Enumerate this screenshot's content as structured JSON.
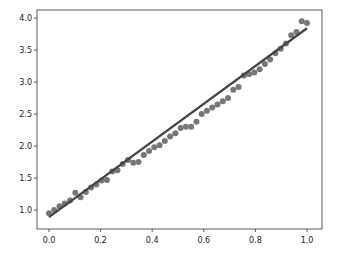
{
  "chart_data": {
    "type": "scatter",
    "title": "",
    "xlabel": "",
    "ylabel": "",
    "xlim": [
      -0.05,
      1.05
    ],
    "ylim": [
      0.7,
      4.1
    ],
    "grid": false,
    "legend": null,
    "xticks": [
      0.0,
      0.2,
      0.4,
      0.6,
      0.8,
      1.0
    ],
    "xtick_labels": [
      "0.0",
      "0.2",
      "0.4",
      "0.6",
      "0.8",
      "1.0"
    ],
    "yticks": [
      1.0,
      1.5,
      2.0,
      2.5,
      3.0,
      3.5,
      4.0
    ],
    "ytick_labels": [
      "1.0",
      "1.5",
      "2.0",
      "2.5",
      "3.0",
      "3.5",
      "4.0"
    ],
    "series": [
      {
        "name": "data",
        "kind": "scatter",
        "color": "#777777",
        "x": [
          0.0,
          0.0204,
          0.0408,
          0.0612,
          0.0816,
          0.102,
          0.1224,
          0.1429,
          0.1633,
          0.1837,
          0.2041,
          0.2245,
          0.2449,
          0.2653,
          0.2857,
          0.3061,
          0.3265,
          0.3469,
          0.3673,
          0.3878,
          0.4082,
          0.4286,
          0.449,
          0.4694,
          0.4898,
          0.5102,
          0.5306,
          0.551,
          0.5714,
          0.5918,
          0.6122,
          0.6327,
          0.6531,
          0.6735,
          0.6939,
          0.7143,
          0.7347,
          0.7551,
          0.7755,
          0.7959,
          0.8163,
          0.8367,
          0.8571,
          0.8776,
          0.898,
          0.9184,
          0.9388,
          0.9592,
          0.9796,
          1.0
        ],
        "y": [
          0.95,
          1.0,
          1.06,
          1.1,
          1.15,
          1.27,
          1.2,
          1.28,
          1.35,
          1.4,
          1.46,
          1.47,
          1.6,
          1.62,
          1.72,
          1.78,
          1.74,
          1.75,
          1.86,
          1.92,
          1.98,
          2.01,
          2.08,
          2.15,
          2.2,
          2.28,
          2.3,
          2.3,
          2.38,
          2.5,
          2.55,
          2.6,
          2.65,
          2.7,
          2.75,
          2.88,
          2.92,
          3.1,
          3.12,
          3.15,
          3.2,
          3.28,
          3.35,
          3.45,
          3.52,
          3.6,
          3.73,
          3.78,
          3.95,
          3.92
        ]
      },
      {
        "name": "fit",
        "kind": "line",
        "color": "#444444",
        "x": [
          0.0,
          1.0
        ],
        "y": [
          0.89,
          3.84
        ]
      }
    ]
  },
  "axes": {
    "frame": {
      "left": 37,
      "top": 10,
      "right": 322,
      "bottom": 229
    }
  }
}
